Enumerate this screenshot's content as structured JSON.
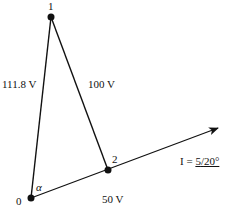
{
  "diagram": {
    "type": "phasor-diagram",
    "nodes": [
      {
        "id": "0",
        "label": "0",
        "x": 31,
        "y": 198
      },
      {
        "id": "1",
        "label": "1",
        "x": 51,
        "y": 17
      },
      {
        "id": "2",
        "label": "2",
        "x": 108,
        "y": 170
      }
    ],
    "edges": [
      {
        "from": "0",
        "to": "1",
        "label": "111.8 V"
      },
      {
        "from": "1",
        "to": "2",
        "label": "100 V"
      },
      {
        "from": "0",
        "to": "2",
        "label": "50 V"
      }
    ],
    "angle_label": "α",
    "current_phasor": {
      "prefix": "I = ",
      "magnitude": "5",
      "angle": "20°",
      "tip": {
        "x": 218,
        "y": 128
      }
    },
    "colors": {
      "stroke": "#111111",
      "background": "#ffffff"
    }
  }
}
